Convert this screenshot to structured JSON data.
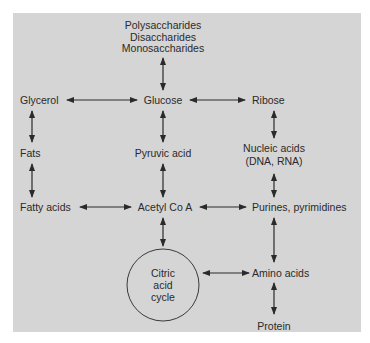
{
  "diagram": {
    "nodes": {
      "saccharides": [
        "Polysaccharides",
        "Disaccharides",
        "Monosaccharides"
      ],
      "glycerol": "Glycerol",
      "glucose": "Glucose",
      "ribose": "Ribose",
      "fats": "Fats",
      "pyruvic_acid": "Pyruvic acid",
      "nucleic_acids": [
        "Nucleic acids",
        "(DNA, RNA)"
      ],
      "fatty_acids": "Fatty acids",
      "acetyl_coa": "Acetyl Co A",
      "purines": "Purines, pyrimidines",
      "citric_cycle": [
        "Citric",
        "acid",
        "cycle"
      ],
      "amino_acids": "Amino acids",
      "protein": "Protein"
    },
    "edges": [
      [
        "Monosaccharides",
        "Glucose"
      ],
      [
        "Glycerol",
        "Glucose"
      ],
      [
        "Glucose",
        "Ribose"
      ],
      [
        "Glycerol",
        "Fats"
      ],
      [
        "Glucose",
        "Pyruvic acid"
      ],
      [
        "Ribose",
        "Nucleic acids"
      ],
      [
        "Fats",
        "Fatty acids"
      ],
      [
        "Pyruvic acid",
        "Acetyl Co A"
      ],
      [
        "Nucleic acids",
        "Purines, pyrimidines"
      ],
      [
        "Fatty acids",
        "Acetyl Co A"
      ],
      [
        "Acetyl Co A",
        "Purines, pyrimidines"
      ],
      [
        "Acetyl Co A",
        "Citric acid cycle"
      ],
      [
        "Purines, pyrimidines",
        "Amino acids"
      ],
      [
        "Citric acid cycle",
        "Amino acids"
      ],
      [
        "Amino acids",
        "Protein"
      ]
    ],
    "colors": {
      "panel": "#d5d5d5",
      "ink": "#2a2a2a"
    }
  }
}
